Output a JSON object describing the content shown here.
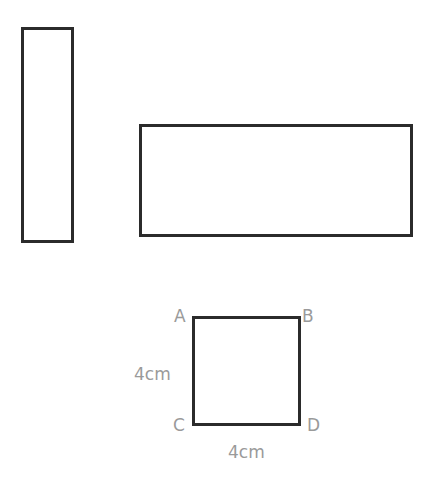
{
  "shapes": {
    "tall_rectangle": {
      "x": 21,
      "y": 27,
      "w": 53,
      "h": 216
    },
    "wide_rectangle": {
      "x": 139,
      "y": 124,
      "w": 274,
      "h": 113
    },
    "square": {
      "x": 192,
      "y": 316,
      "w": 109,
      "h": 110
    }
  },
  "square_labels": {
    "vertex_a": "A",
    "vertex_b": "B",
    "vertex_c": "C",
    "vertex_d": "D",
    "side_left": "4cm",
    "side_bottom": "4cm"
  },
  "colors": {
    "stroke": "#2b2b2b",
    "label": "#9a9a9a"
  }
}
